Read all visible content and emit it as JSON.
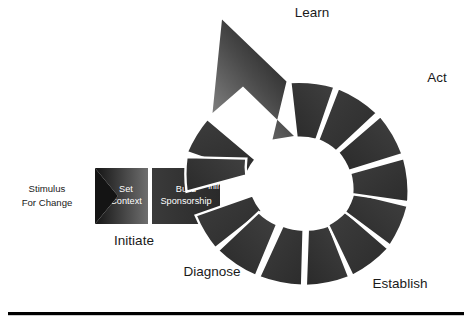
{
  "diagram": {
    "colors": {
      "segment_dark": "#333333",
      "segment_darker": "#1e1e1e",
      "segment_light_edge": "#5a5a5a",
      "divider": "#ffffff",
      "text_on_dark": "#ffffff",
      "text_on_light": "#1a1a1a",
      "background": "#ffffff",
      "rule": "#000000"
    },
    "entry": {
      "stimulus_label_line1": "Stimulus",
      "stimulus_label_line2": "For Change",
      "set_context_line1": "Set",
      "set_context_line2": "Context",
      "build_sponsorship_line1": "Build",
      "build_sponsorship_line2": "Sponsorship"
    },
    "segments": [
      {
        "id": "charter-infrastructure",
        "lines": [
          "Charter",
          "Infrastructure"
        ]
      },
      {
        "id": "characterize-states",
        "lines": [
          "Characterize",
          "Current &",
          "Desired",
          "States"
        ]
      },
      {
        "id": "develop-recommendations",
        "lines": [
          "Develop",
          "Recommen-",
          "dations"
        ]
      },
      {
        "id": "set-priorities",
        "lines": [
          "Set",
          "Priorities"
        ]
      },
      {
        "id": "develop-approach",
        "lines": [
          "Develop",
          "Approach"
        ]
      },
      {
        "id": "plan-actions",
        "lines": [
          "Plan",
          "Actions"
        ]
      },
      {
        "id": "create-solution",
        "lines": [
          "Create",
          "Solution"
        ]
      },
      {
        "id": "pilot-test-solution",
        "lines": [
          "Pilot/Test",
          "Solution"
        ]
      },
      {
        "id": "refine-solution",
        "lines": [
          "Refine",
          "Solution"
        ]
      },
      {
        "id": "implement-solution",
        "lines": [
          "Implement",
          "Solution"
        ]
      },
      {
        "id": "analyze-validate",
        "lines": [
          "Analyze &",
          "Validate"
        ]
      },
      {
        "id": "propose-future-actions",
        "lines": [
          "Propose",
          "Future",
          "Actions"
        ]
      }
    ],
    "stages": [
      {
        "id": "initiate",
        "label": "Initiate"
      },
      {
        "id": "diagnose",
        "label": "Diagnose"
      },
      {
        "id": "establish",
        "label": "Establish"
      },
      {
        "id": "act",
        "label": "Act"
      },
      {
        "id": "learn",
        "label": "Learn"
      }
    ]
  }
}
